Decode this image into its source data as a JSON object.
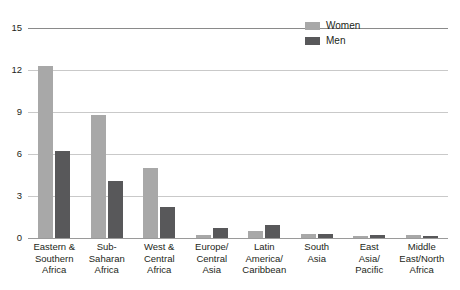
{
  "chart_data": {
    "type": "bar",
    "title": "",
    "xlabel": "",
    "ylabel": "",
    "ylim": [
      0,
      15
    ],
    "yticks": [
      0,
      3,
      6,
      9,
      12,
      15
    ],
    "grid": true,
    "legend_position": "top-right",
    "categories": [
      "Eastern &\nSouthern\nAfrica",
      "Sub-\nSaharan\nAfrica",
      "West &\nCentral\nAfrica",
      "Europe/\nCentral\nAsia",
      "Latin\nAmerica/\nCaribbean",
      "South\nAsia",
      "East\nAsia/\nPacific",
      "Middle\nEast/North\nAfrica"
    ],
    "category_lines": [
      [
        "Eastern &",
        "Southern",
        "Africa"
      ],
      [
        "Sub-",
        "Saharan",
        "Africa"
      ],
      [
        "West &",
        "Central",
        "Africa"
      ],
      [
        "Europe/",
        "Central",
        "Asia"
      ],
      [
        "Latin",
        "America/",
        "Caribbean"
      ],
      [
        "South",
        "Asia"
      ],
      [
        "East",
        "Asia/",
        "Pacific"
      ],
      [
        "Middle",
        "East/North",
        "Africa"
      ]
    ],
    "series": [
      {
        "name": "Women",
        "color": "#a8a8a8",
        "values": [
          12.3,
          8.8,
          5.0,
          0.2,
          0.5,
          0.3,
          0.15,
          0.25
        ]
      },
      {
        "name": "Men",
        "color": "#58585a",
        "values": [
          6.2,
          4.1,
          2.2,
          0.7,
          0.9,
          0.3,
          0.2,
          0.15
        ]
      }
    ]
  },
  "legend": {
    "items": [
      {
        "label": "Women",
        "color": "#a8a8a8"
      },
      {
        "label": "Men",
        "color": "#58585a"
      }
    ]
  },
  "axis": {
    "y_tick_labels": [
      "15",
      "12",
      "9",
      "6",
      "3",
      "0"
    ]
  },
  "colors": {
    "women": "#a8a8a8",
    "men": "#58585a",
    "gridline": "#c9c9c9",
    "axis": "#8a8a8a",
    "text": "#231f20",
    "background": "#ffffff"
  }
}
